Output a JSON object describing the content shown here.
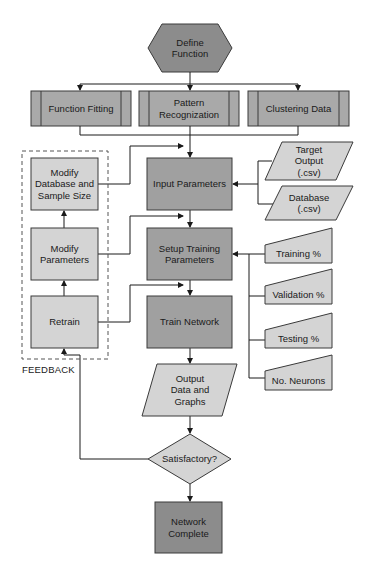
{
  "diagram": {
    "colors": {
      "dark_fill": "#8c8c8c",
      "mid_fill": "#a9a9a9",
      "light_fill": "#d4d4d4",
      "stroke": "#3a3a3a"
    },
    "nodes": {
      "define_function": "Define\nFunction",
      "function_fitting": "Function Fitting",
      "pattern_recognization": "Pattern\nRecognization",
      "clustering_data": "Clustering Data",
      "input_parameters": "Input Parameters",
      "target_output": "Target\nOutput\n(.csv)",
      "database": "Database\n(.csv)",
      "setup_training_parameters": "Setup Training\nParameters",
      "training_pct": "Training %",
      "validation_pct": "Validation %",
      "testing_pct": "Testing %",
      "no_neurons": "No. Neurons",
      "train_network": "Train Network",
      "output_data_graphs": "Output\nData and\nGraphs",
      "satisfactory": "Satisfactory?",
      "network_complete": "Network\nComplete",
      "modify_database": "Modify\nDatabase and\nSample Size",
      "modify_parameters": "Modify\nParameters",
      "retrain": "Retrain"
    },
    "group_label": "FEEDBACK"
  }
}
